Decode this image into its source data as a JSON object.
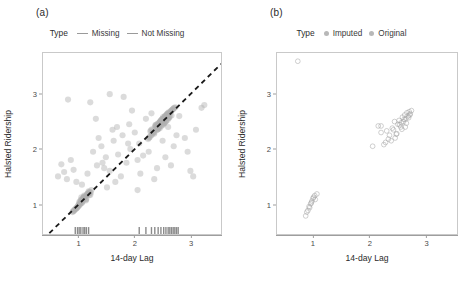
{
  "figure": {
    "panels": [
      {
        "label": "(a)",
        "legend": {
          "title": "Type",
          "key_style": "line",
          "entries": [
            {
              "label": "Missing",
              "color": "#9a9a9a"
            },
            {
              "label": "Not Missing",
              "color": "#b5b5b5"
            }
          ]
        },
        "chart_data": {
          "type": "scatter",
          "title": "",
          "xlabel": "14-day Lag",
          "ylabel": "Halsted Ridership",
          "xlim": [
            0.35,
            3.55
          ],
          "ylim": [
            0.45,
            3.75
          ],
          "xticks": [
            1,
            2,
            3
          ],
          "yticks": [
            1,
            2,
            3
          ],
          "grid": false,
          "legend_position": "top",
          "point_color": "#b0b0b0",
          "point_opacity": 0.45,
          "point_radius": 3.1,
          "reference_line": {
            "type": "dashed",
            "slope": 1,
            "intercept": 0,
            "color": "#1a1a1a",
            "width": 1.8,
            "dash": "5,4"
          },
          "rug": {
            "present": true,
            "color": "#8a8a8a",
            "values": [
              0.93,
              0.97,
              1.0,
              1.03,
              1.07,
              1.1,
              1.13,
              1.17,
              2.08,
              2.2,
              2.3,
              2.36,
              2.42,
              2.47,
              2.52,
              2.56,
              2.6,
              2.63,
              2.66,
              2.69,
              2.72,
              2.75,
              2.78
            ]
          },
          "series": [
            {
              "name": "Not Missing",
              "x": [
                0.98,
                1.02,
                1.05,
                0.95,
                1.09,
                1.12,
                0.91,
                1.15,
                1.0,
                1.07,
                0.93,
                1.18,
                1.04,
                0.88,
                1.2,
                1.1,
                0.97,
                1.13,
                1.01,
                1.06,
                0.9,
                1.16,
                1.03,
                1.08,
                0.99,
                1.11,
                0.94,
                1.19,
                1.02,
                1.14,
                0.96,
                1.21,
                1.05,
                1.09,
                0.92,
                1.17,
                1.0,
                1.12,
                1.04,
                1.07,
                0.89,
                1.22,
                1.01,
                1.15,
                0.98,
                1.1,
                1.06,
                1.03,
                0.95,
                1.18,
                2.3,
                2.38,
                2.45,
                2.52,
                2.58,
                2.25,
                2.42,
                2.49,
                2.56,
                2.62,
                2.33,
                2.4,
                2.47,
                2.54,
                2.6,
                2.28,
                2.44,
                2.51,
                2.57,
                2.64,
                2.35,
                2.41,
                2.48,
                2.55,
                2.61,
                2.31,
                2.43,
                2.5,
                2.59,
                2.66,
                2.36,
                2.39,
                2.46,
                2.53,
                2.63,
                2.27,
                2.45,
                2.52,
                2.58,
                2.68,
                2.34,
                2.42,
                2.49,
                2.56,
                2.65,
                2.29,
                2.44,
                2.51,
                2.6,
                2.7,
                2.37,
                2.4,
                2.47,
                2.54,
                2.62,
                2.32,
                2.46,
                2.53,
                2.59,
                2.67,
                2.26,
                2.43,
                2.5,
                2.57,
                2.69,
                2.38,
                2.41,
                2.48,
                2.55,
                2.71,
                2.24,
                2.35,
                2.44,
                2.52,
                2.61,
                2.3,
                2.47,
                2.54,
                2.63,
                2.73,
                2.39,
                2.42,
                2.5,
                2.58,
                2.66
              ],
              "y": [
                0.95,
                1.0,
                1.08,
                0.92,
                1.12,
                1.06,
                0.88,
                1.18,
                1.03,
                1.1,
                0.9,
                1.21,
                1.01,
                0.85,
                1.16,
                1.13,
                0.94,
                1.09,
                0.98,
                1.04,
                0.87,
                1.19,
                1.07,
                1.11,
                0.96,
                1.14,
                0.91,
                1.22,
                1.05,
                1.17,
                0.93,
                1.2,
                1.02,
                1.15,
                0.89,
                1.23,
                0.99,
                1.08,
                1.12,
                1.06,
                0.86,
                1.25,
                1.0,
                1.18,
                0.97,
                1.13,
                1.09,
                1.04,
                0.92,
                1.16,
                2.25,
                2.41,
                2.38,
                2.55,
                2.62,
                2.2,
                2.45,
                2.52,
                2.5,
                2.65,
                2.3,
                2.35,
                2.51,
                2.58,
                2.56,
                2.32,
                2.48,
                2.44,
                2.61,
                2.68,
                2.28,
                2.46,
                2.42,
                2.6,
                2.57,
                2.36,
                2.39,
                2.55,
                2.53,
                2.7,
                2.4,
                2.43,
                2.5,
                2.47,
                2.66,
                2.22,
                2.49,
                2.56,
                2.63,
                2.72,
                2.31,
                2.37,
                2.54,
                2.51,
                2.69,
                2.34,
                2.41,
                2.58,
                2.64,
                2.74,
                2.43,
                2.35,
                2.52,
                2.6,
                2.57,
                2.29,
                2.5,
                2.47,
                2.65,
                2.71,
                2.21,
                2.46,
                2.55,
                2.62,
                2.73,
                2.44,
                2.38,
                2.53,
                2.59,
                2.75,
                2.18,
                2.3,
                2.4,
                2.48,
                2.67,
                2.26,
                2.51,
                2.49,
                2.6,
                2.76,
                2.42,
                2.36,
                2.45,
                2.63,
                2.61
              ]
            },
            {
              "name": "Missing",
              "x": [
                0.62,
                0.68,
                0.73,
                0.78,
                0.85,
                0.9,
                1.25,
                1.32,
                1.4,
                1.48,
                1.55,
                1.62,
                1.7,
                1.78,
                1.85,
                1.92,
                2.0,
                2.08,
                2.15,
                0.95,
                1.05,
                1.15,
                1.35,
                1.45,
                1.6,
                1.75,
                1.9,
                2.05,
                2.2,
                2.35,
                2.5,
                2.65,
                2.8,
                2.95,
                3.1,
                3.25,
                1.3,
                1.5,
                1.68,
                1.88,
                2.1,
                2.3,
                2.55,
                2.75,
                3.0,
                0.8,
                1.2,
                1.42,
                1.65,
                1.95,
                2.25,
                2.6,
                2.9,
                3.2,
                1.55,
                1.8,
                2.05,
                2.4,
                2.7,
                3.05
              ],
              "y": [
                1.5,
                1.72,
                1.58,
                1.45,
                1.8,
                1.62,
                1.95,
                1.7,
                2.05,
                1.85,
                1.6,
                2.15,
                1.9,
                2.25,
                1.75,
                2.0,
                2.3,
                2.1,
                1.88,
                1.4,
                1.35,
                1.55,
                2.2,
                1.65,
                2.35,
                1.5,
                2.45,
                1.8,
                2.55,
                1.45,
                2.15,
                1.7,
                2.6,
                1.95,
                2.35,
                2.8,
                2.55,
                1.3,
                2.4,
                2.1,
                1.55,
                2.65,
                1.85,
                2.25,
                1.6,
                2.9,
                2.85,
                1.75,
                1.4,
                2.7,
                1.95,
                2.4,
                2.2,
                2.75,
                3.0,
                2.95,
                1.25,
                1.65,
                2.05,
                1.5
              ]
            }
          ]
        }
      },
      {
        "label": "(b)",
        "legend": {
          "title": "Type",
          "key_style": "point",
          "entries": [
            {
              "label": "Imputed",
              "color": "#bdbdbd"
            },
            {
              "label": "Original",
              "color": "#c7c7c7"
            }
          ]
        },
        "chart_data": {
          "type": "scatter",
          "title": "",
          "xlabel": "14-day Lag",
          "ylabel": "Halsted Ridership",
          "xlim": [
            0.35,
            3.55
          ],
          "ylim": [
            0.45,
            3.75
          ],
          "xticks": [
            1,
            2,
            3
          ],
          "yticks": [
            1,
            2,
            3
          ],
          "grid": false,
          "legend_position": "top",
          "point_color": "#9e9e9e",
          "point_opacity": 0.55,
          "point_radius": 2.4,
          "point_fill": "none",
          "reference_line": null,
          "rug": {
            "present": false
          },
          "series": [
            {
              "name": "Original",
              "x": [
                0.72,
                0.86,
                0.9,
                0.93,
                0.95,
                0.97,
                1.0,
                1.03,
                1.06,
                2.05,
                2.2,
                2.28,
                2.35,
                2.4,
                2.45,
                2.5,
                2.52,
                2.55,
                2.58,
                2.6,
                2.62,
                2.64,
                2.66,
                2.68,
                2.7,
                2.72,
                2.74,
                2.2,
                2.33,
                2.42,
                2.48,
                2.56,
                2.63,
                2.69
              ],
              "y": [
                3.6,
                0.78,
                0.88,
                0.93,
                1.0,
                1.05,
                1.12,
                1.08,
                1.18,
                2.05,
                2.3,
                2.12,
                2.25,
                2.38,
                2.2,
                2.45,
                2.52,
                2.4,
                2.58,
                2.5,
                2.62,
                2.55,
                2.66,
                2.6,
                2.68,
                2.64,
                2.7,
                2.42,
                2.18,
                2.35,
                2.28,
                2.48,
                2.4,
                2.57
              ]
            },
            {
              "name": "Imputed",
              "x": [
                0.88,
                0.92,
                0.96,
                0.99,
                1.02,
                2.15,
                2.25,
                2.3,
                2.38,
                2.44,
                2.47,
                2.53,
                2.57,
                2.61,
                2.65,
                2.71
              ],
              "y": [
                0.85,
                0.95,
                1.02,
                1.1,
                1.15,
                2.42,
                2.08,
                2.33,
                2.15,
                2.5,
                2.27,
                2.44,
                2.36,
                2.54,
                2.47,
                2.62
              ]
            }
          ]
        }
      }
    ]
  }
}
